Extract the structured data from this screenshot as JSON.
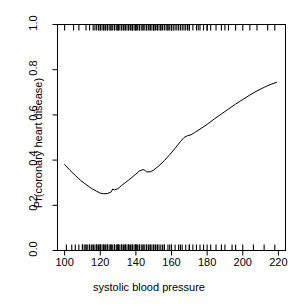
{
  "chart_data": {
    "type": "line",
    "title": "",
    "subtitle": "",
    "xlabel": "systolic blood pressure",
    "ylabel": "Pr(coronary heart disease)",
    "xlim": [
      96,
      224
    ],
    "ylim": [
      0.0,
      1.0
    ],
    "grid": false,
    "legend": null,
    "xticks": [
      100,
      120,
      140,
      160,
      180,
      200,
      220
    ],
    "xtick_labels": [
      "100",
      "120",
      "140",
      "160",
      "180",
      "200",
      "220"
    ],
    "yticks": [
      0.0,
      0.2,
      0.4,
      0.6,
      0.8,
      1.0
    ],
    "ytick_labels": [
      "0.0",
      "0.2",
      "0.4",
      "0.6",
      "0.8",
      "1.0"
    ],
    "series": [
      {
        "name": "fitted probability",
        "color": "#000000",
        "x": [
          100,
          103,
          106,
          109,
          112,
          115,
          118,
          120,
          122,
          124,
          126,
          127,
          128,
          130,
          132,
          134,
          136,
          138,
          140,
          142,
          144,
          145,
          146,
          148,
          150,
          153,
          156,
          159,
          162,
          165,
          167,
          169,
          171,
          173,
          176,
          180,
          184,
          188,
          192,
          196,
          200,
          204,
          208,
          212,
          216,
          219
        ],
        "y": [
          0.38,
          0.355,
          0.332,
          0.31,
          0.292,
          0.275,
          0.262,
          0.254,
          0.251,
          0.252,
          0.258,
          0.272,
          0.268,
          0.274,
          0.288,
          0.3,
          0.312,
          0.325,
          0.338,
          0.352,
          0.358,
          0.355,
          0.348,
          0.348,
          0.356,
          0.375,
          0.398,
          0.424,
          0.452,
          0.482,
          0.5,
          0.508,
          0.512,
          0.522,
          0.537,
          0.558,
          0.582,
          0.604,
          0.626,
          0.648,
          0.668,
          0.688,
          0.706,
          0.722,
          0.736,
          0.744
        ]
      }
    ],
    "rug_top": {
      "name": "cases (y = 1)",
      "y_value": 1.0,
      "x": [
        100,
        105,
        108,
        112,
        114,
        116,
        117,
        118,
        119,
        120,
        120,
        121,
        122,
        122,
        123,
        124,
        124,
        125,
        126,
        126,
        127,
        128,
        128,
        129,
        130,
        130,
        130,
        131,
        132,
        132,
        133,
        134,
        134,
        135,
        136,
        136,
        137,
        138,
        138,
        138,
        139,
        140,
        140,
        140,
        141,
        142,
        142,
        143,
        144,
        144,
        145,
        146,
        146,
        147,
        148,
        148,
        149,
        150,
        150,
        150,
        151,
        152,
        152,
        153,
        154,
        154,
        155,
        156,
        157,
        158,
        158,
        159,
        160,
        160,
        160,
        161,
        162,
        163,
        164,
        165,
        166,
        167,
        168,
        169,
        170,
        170,
        172,
        174,
        175,
        176,
        178,
        180,
        180,
        182,
        185,
        188,
        190,
        192,
        196,
        200,
        204,
        208,
        214,
        218
      ]
    },
    "rug_bottom": {
      "name": "non-cases (y = 0)",
      "y_value": 0.0,
      "x": [
        101,
        104,
        106,
        108,
        110,
        110,
        111,
        112,
        112,
        113,
        114,
        114,
        115,
        116,
        116,
        117,
        118,
        118,
        118,
        119,
        120,
        120,
        120,
        120,
        121,
        122,
        122,
        122,
        123,
        124,
        124,
        124,
        125,
        126,
        126,
        126,
        127,
        128,
        128,
        128,
        129,
        130,
        130,
        130,
        130,
        131,
        132,
        132,
        132,
        133,
        134,
        134,
        134,
        135,
        136,
        136,
        136,
        137,
        138,
        138,
        138,
        139,
        140,
        140,
        140,
        140,
        141,
        142,
        142,
        142,
        143,
        144,
        144,
        145,
        146,
        146,
        147,
        148,
        148,
        149,
        150,
        150,
        151,
        152,
        152,
        153,
        154,
        155,
        156,
        156,
        158,
        159,
        160,
        160,
        162,
        164,
        165,
        166,
        168,
        170,
        170,
        172,
        174,
        176,
        178,
        180,
        182,
        185,
        188,
        190,
        194,
        196,
        200,
        206,
        212,
        218
      ]
    }
  },
  "axes": {
    "x_label": "systolic blood pressure",
    "y_label": "Pr(coronary heart disease)"
  }
}
